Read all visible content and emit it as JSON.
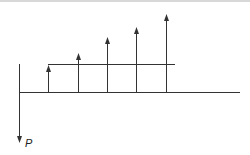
{
  "diagram": {
    "type": "cash-flow-diagram",
    "colors": {
      "line": "#333333",
      "background": "#ffffff"
    },
    "axis": {
      "y": 92,
      "x_start": 19,
      "x_end": 240
    },
    "gradient_base_line": {
      "y": 64,
      "x_start": 48,
      "x_end": 175
    },
    "present_value": {
      "label": "P",
      "x": 19,
      "y_start": 64,
      "y_end": 143
    },
    "receipts": [
      {
        "x": 48,
        "tip_y": 65
      },
      {
        "x": 78,
        "tip_y": 53
      },
      {
        "x": 107,
        "tip_y": 37
      },
      {
        "x": 136,
        "tip_y": 27
      },
      {
        "x": 166,
        "tip_y": 14
      }
    ]
  }
}
